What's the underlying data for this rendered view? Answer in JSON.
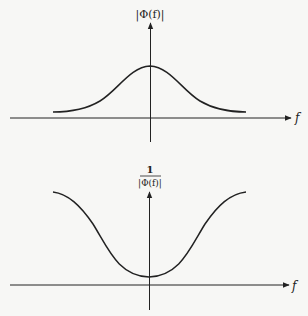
{
  "diagram": {
    "colors": {
      "background": "#f7f7f5",
      "ink": "#222222"
    },
    "plots": [
      {
        "id": "top",
        "y_label": "|Φ(f)|",
        "x_label": "f",
        "curve": "bell",
        "description": "Gaussian-like magnitude |Φ(f)| peaked at f=0"
      },
      {
        "id": "bottom",
        "y_label_numerator": "1",
        "y_label_denominator": "|Φ(f)|",
        "x_label": "f",
        "curve": "inverted-bell",
        "description": "Reciprocal 1/|Φ(f)|, minimum at f=0 rising toward edges"
      }
    ]
  }
}
